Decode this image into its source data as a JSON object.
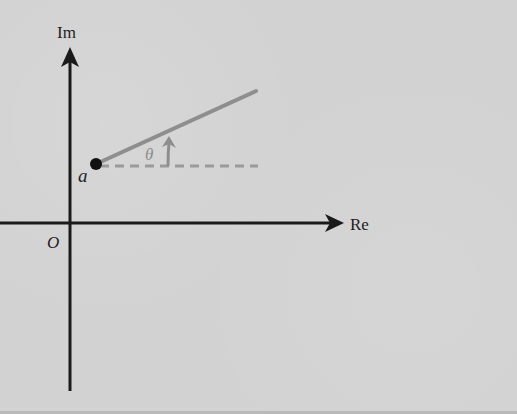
{
  "diagram": {
    "axes": {
      "imaginary_label": "Im",
      "real_label": "Re",
      "origin_label": "O"
    },
    "point": {
      "label": "a"
    },
    "angle": {
      "label": "θ"
    },
    "colors": {
      "axis": "#1a1a1a",
      "ray": "#8e8e8e",
      "dashed_reference": "#9a9a9a",
      "point": "#111111",
      "background": "#d2d2d2"
    }
  }
}
